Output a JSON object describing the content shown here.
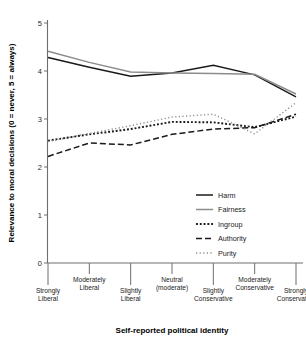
{
  "chart_data": {
    "type": "line",
    "title": "",
    "xlabel": "Self-reported political identity",
    "ylabel": "Relevance to moral decisions  (0 = never, 5 = always)",
    "ylim": [
      0,
      5
    ],
    "yticks": [
      0,
      1,
      2,
      3,
      4,
      5
    ],
    "yticklabels": [
      "0",
      "1",
      "2",
      "3",
      "4",
      "5"
    ],
    "grid": false,
    "legend_position": "center-right",
    "categories": [
      "Strongly Liberal",
      "Moderately Liberal",
      "Slightly Liberal",
      "Neutral (moderate)",
      "Slightly Conservative",
      "Moderately Conservative",
      "Strongly Conservative"
    ],
    "category_label_lines": [
      [
        "Strongly",
        "Liberal"
      ],
      [
        "Moderately",
        "Liberal"
      ],
      [
        "Slightly",
        "Liberal"
      ],
      [
        "Neutral",
        "(moderate)"
      ],
      [
        "Slightly",
        "Conservative"
      ],
      [
        "Moderately",
        "Conservative"
      ],
      [
        "Strongly",
        "Conservative"
      ]
    ],
    "series": [
      {
        "name": "Harm",
        "style": "solid",
        "color": "#1a1a1a",
        "values": [
          4.28,
          4.08,
          3.89,
          3.96,
          4.12,
          3.92,
          3.46
        ]
      },
      {
        "name": "Fairness",
        "style": "solid",
        "color": "#8c8c8c",
        "values": [
          4.41,
          4.18,
          3.98,
          3.96,
          3.95,
          3.93,
          3.52
        ]
      },
      {
        "name": "Ingroup",
        "style": "thick-dotted",
        "color": "#1a1a1a",
        "values": [
          2.55,
          2.68,
          2.79,
          2.94,
          2.93,
          2.83,
          3.05
        ]
      },
      {
        "name": "Authority",
        "style": "dashed",
        "color": "#1a1a1a",
        "values": [
          2.22,
          2.5,
          2.46,
          2.68,
          2.79,
          2.82,
          3.1
        ]
      },
      {
        "name": "Purity",
        "style": "fine-dotted",
        "color": "#8c8c8c",
        "values": [
          2.53,
          2.7,
          2.86,
          3.04,
          3.1,
          2.69,
          3.34
        ]
      }
    ]
  },
  "legend": {
    "items": [
      {
        "label": "Harm"
      },
      {
        "label": "Fairness"
      },
      {
        "label": "Ingroup"
      },
      {
        "label": "Authority"
      },
      {
        "label": "Purity"
      }
    ]
  },
  "axes": {
    "y_title": "Relevance to moral decisions  (0 = never, 5 = always)",
    "x_title": "Self-reported political identity"
  }
}
